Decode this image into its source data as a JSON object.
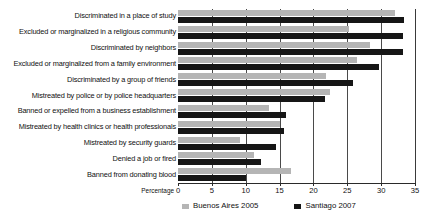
{
  "chart_data": {
    "type": "bar",
    "orientation": "horizontal",
    "title": "",
    "xlabel": "Percentage",
    "ylabel": "",
    "xlim": [
      0,
      35
    ],
    "xticks": [
      0,
      5,
      10,
      15,
      20,
      25,
      30,
      35
    ],
    "grid": true,
    "legend_position": "bottom",
    "categories": [
      "Discriminated in a place of study",
      "Excluded or marginalized in a religious community",
      "Discriminated by neighbors",
      "Excluded or marginalized from a family environment",
      "Discriminated by a group of friends",
      "Mistreated by police or by police headquarters",
      "Banned or expelled from a business establishment",
      "Mistreated by health clinics or health professionals",
      "Mistreated by security guards",
      "Denied a job or fired",
      "Banned from donating blood"
    ],
    "series": [
      {
        "name": "Buenos Aires 2005",
        "color": "#b5b5b5",
        "values": [
          32.0,
          25.3,
          28.3,
          26.5,
          21.8,
          22.4,
          13.4,
          15.0,
          9.2,
          11.2,
          16.7
        ]
      },
      {
        "name": "Santiago 2007",
        "color": "#161616",
        "values": [
          33.4,
          33.3,
          33.2,
          29.7,
          25.9,
          21.7,
          16.0,
          15.6,
          14.5,
          12.2,
          10.0
        ]
      }
    ]
  }
}
